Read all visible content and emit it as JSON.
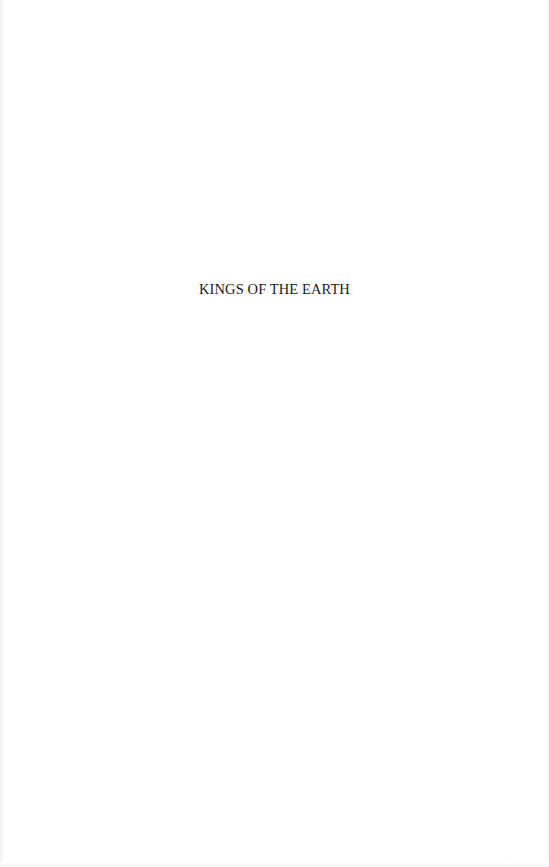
{
  "page": {
    "type": "half-title page",
    "title": "KINGS OF THE EARTH"
  }
}
